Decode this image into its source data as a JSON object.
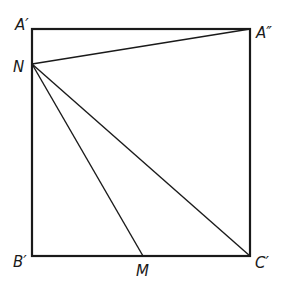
{
  "diagram": {
    "type": "geometry",
    "stroke_color": "#1a1a1a",
    "background": "#ffffff",
    "points": {
      "A_prime": {
        "label": "A′",
        "x": 32,
        "y": 29
      },
      "A_dprime": {
        "label": "A″",
        "x": 250,
        "y": 29
      },
      "N": {
        "label": "N",
        "x": 32,
        "y": 64
      },
      "B_prime": {
        "label": "B′",
        "x": 32,
        "y": 256
      },
      "M": {
        "label": "M",
        "x": 143,
        "y": 256
      },
      "C_prime": {
        "label": "C′",
        "x": 250,
        "y": 256
      }
    },
    "square": [
      "A′",
      "A″",
      "C′",
      "B′"
    ],
    "segments": [
      [
        "N",
        "A″"
      ],
      [
        "N",
        "M"
      ],
      [
        "N",
        "C′"
      ]
    ],
    "labels": {
      "a_prime": "A′",
      "a_double_prime": "A″",
      "n": "N",
      "b_prime": "B′",
      "m": "M",
      "c_prime": "C′"
    }
  }
}
